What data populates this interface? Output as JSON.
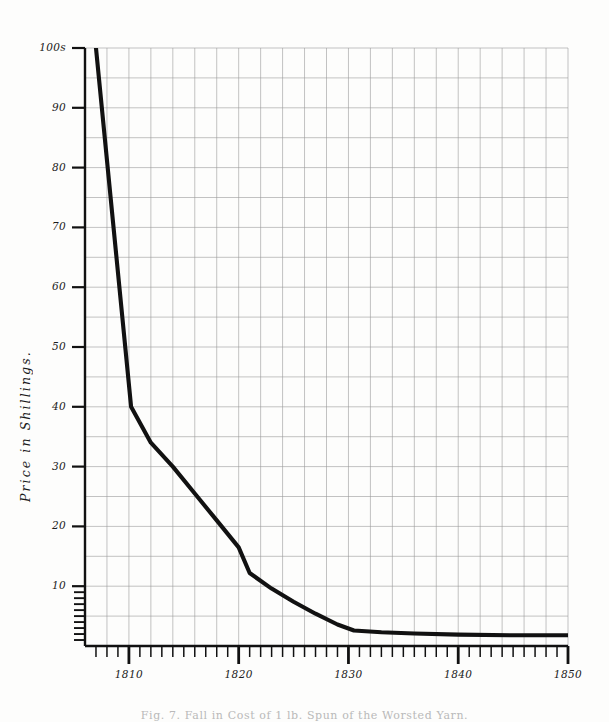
{
  "figure": {
    "caption": "Fig. 7. Fall in Cost of 1 lb. Spun of the Worsted Yarn."
  },
  "chart_data": {
    "type": "line",
    "title": "",
    "xlabel": "",
    "ylabel": "Price in Shillings.",
    "xlim": [
      1806,
      1850
    ],
    "ylim": [
      0,
      100
    ],
    "grid": true,
    "legend": null,
    "y_ticks": [
      10,
      20,
      30,
      40,
      50,
      60,
      70,
      80,
      90,
      100
    ],
    "y_tick_labels": [
      "10",
      "20",
      "30",
      "40",
      "50",
      "60",
      "70",
      "80",
      "90",
      "100s"
    ],
    "y_minor_ticks": [
      1,
      2,
      3,
      4,
      5,
      6,
      7,
      8,
      9
    ],
    "x_ticks": [
      1810,
      1820,
      1830,
      1840,
      1850
    ],
    "x_tick_labels": [
      "1810",
      "1820",
      "1830",
      "1840",
      "1850"
    ],
    "x_minor_tick_interval": 1,
    "series": [
      {
        "name": "Price of 1 lb worsted yarn",
        "x": [
          1807.0,
          1810.2,
          1812.0,
          1814.0,
          1816.0,
          1818.0,
          1820.0,
          1821.0,
          1823.0,
          1825.0,
          1827.0,
          1829.0,
          1830.5,
          1833.0,
          1836.0,
          1840.0,
          1845.0,
          1850.0
        ],
        "values": [
          100.0,
          40.0,
          34.0,
          30.0,
          25.5,
          21.0,
          16.5,
          12.2,
          9.6,
          7.4,
          5.4,
          3.6,
          2.6,
          2.3,
          2.1,
          1.9,
          1.8,
          1.8
        ]
      }
    ]
  },
  "axis": {
    "y_title": "Price in Shillings."
  }
}
